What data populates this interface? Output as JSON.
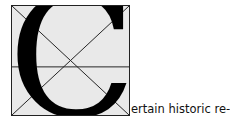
{
  "dropcap": {
    "letter": "C",
    "icon": "grid-construction-icon"
  },
  "text": {
    "continuation": "ertain historic re-"
  },
  "colors": {
    "box_fill": "#e9e9e9",
    "line": "#222222",
    "letter": "#000000"
  }
}
